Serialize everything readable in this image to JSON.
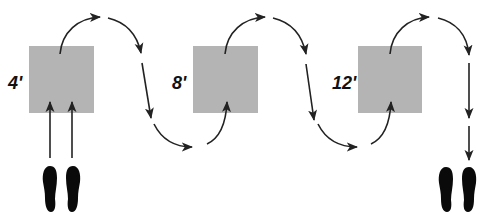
{
  "diagram": {
    "title": "",
    "markers": [
      {
        "label": "4'",
        "x": 29,
        "y": 46,
        "size": 65
      },
      {
        "label": "8'",
        "x": 193,
        "y": 46,
        "size": 65
      },
      {
        "label": "12'",
        "x": 358,
        "y": 46,
        "size": 65
      }
    ],
    "start_icon": "footprints-icon",
    "end_icon": "footprints-icon",
    "path_description": "Walk forward from start through 4' square, weave in S-curves past 8' and 12' squares, end at footprints",
    "colors": {
      "square": "#b4b4b4",
      "arrow": "#222222",
      "footprint": "#0a0a0a",
      "label": "#111111"
    }
  }
}
